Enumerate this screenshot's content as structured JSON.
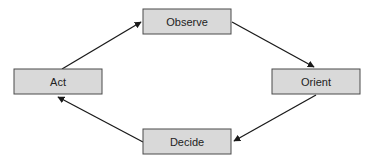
{
  "diagram": {
    "type": "cycle",
    "direction": "clockwise",
    "colors": {
      "box_fill": "#d9d9d9",
      "box_border": "#4a4a4a",
      "arrow": "#1a1a1a",
      "text": "#222222",
      "background": "#ffffff"
    },
    "nodes": [
      {
        "id": "observe",
        "label": "Observe",
        "x": 143,
        "y": 9,
        "w": 88,
        "h": 25
      },
      {
        "id": "orient",
        "label": "Orient",
        "x": 272,
        "y": 69,
        "w": 88,
        "h": 25
      },
      {
        "id": "decide",
        "label": "Decide",
        "x": 143,
        "y": 129,
        "w": 88,
        "h": 25
      },
      {
        "id": "act",
        "label": "Act",
        "x": 14,
        "y": 69,
        "w": 88,
        "h": 25
      }
    ],
    "edges": [
      {
        "from": "act",
        "to": "observe",
        "x1": 62,
        "y1": 69,
        "x2": 141,
        "y2": 22
      },
      {
        "from": "observe",
        "to": "orient",
        "x1": 232,
        "y1": 22,
        "x2": 314,
        "y2": 67
      },
      {
        "from": "orient",
        "to": "decide",
        "x1": 316,
        "y1": 95,
        "x2": 234,
        "y2": 141
      },
      {
        "from": "decide",
        "to": "act",
        "x1": 143,
        "y1": 142,
        "x2": 58,
        "y2": 97
      }
    ]
  }
}
